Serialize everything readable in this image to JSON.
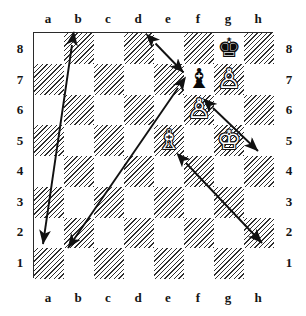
{
  "diagram": {
    "board": {
      "files": [
        "a",
        "b",
        "c",
        "d",
        "e",
        "f",
        "g",
        "h"
      ],
      "ranks": [
        "8",
        "7",
        "6",
        "5",
        "4",
        "3",
        "2",
        "1"
      ],
      "light_square_color": "#ffffff",
      "dark_square_color": "#2e2e2e",
      "border_color": "#2b2b2b",
      "dark_square_style": "diagonal-hatch"
    },
    "pieces": [
      {
        "square": "g8",
        "file": "g",
        "rank": "8",
        "color": "black",
        "type": "king",
        "glyph": "♚",
        "name": "black-king"
      },
      {
        "square": "f7",
        "file": "f",
        "rank": "7",
        "color": "black",
        "type": "bishop",
        "glyph": "♝",
        "name": "black-bishop"
      },
      {
        "square": "g7",
        "file": "g",
        "rank": "7",
        "color": "white",
        "type": "pawn",
        "glyph": "♙",
        "name": "white-pawn-g7"
      },
      {
        "square": "f6",
        "file": "f",
        "rank": "6",
        "color": "white",
        "type": "pawn",
        "glyph": "♙",
        "name": "white-pawn-f6"
      },
      {
        "square": "e5",
        "file": "e",
        "rank": "5",
        "color": "white",
        "type": "bishop",
        "glyph": "♗",
        "name": "white-bishop"
      },
      {
        "square": "g5",
        "file": "g",
        "rank": "5",
        "color": "white",
        "type": "king",
        "glyph": "♔",
        "name": "white-king"
      }
    ],
    "arrows": [
      {
        "id": "arrow-e8-f7",
        "from": "e8",
        "to": "f7",
        "double_headed": true,
        "length": "short",
        "color": "#111111"
      },
      {
        "id": "arrow-b8-a2",
        "from": "b8",
        "to": "a2",
        "double_headed": true,
        "length": "long",
        "color": "#111111"
      },
      {
        "id": "arrow-f7-b2",
        "from": "f7",
        "to": "b2",
        "double_headed": true,
        "length": "long",
        "color": "#111111"
      },
      {
        "id": "arrow-g6-h5",
        "from": "g6",
        "to": "h5",
        "double_headed": true,
        "length": "short",
        "color": "#111111"
      },
      {
        "id": "arrow-f4-h2",
        "from": "f4",
        "to": "h2",
        "double_headed": true,
        "length": "long",
        "color": "#111111"
      }
    ],
    "labels": {
      "top_files": [
        "a",
        "b",
        "c",
        "d",
        "e",
        "f",
        "g",
        "h"
      ],
      "bottom_files": [
        "a",
        "b",
        "c",
        "d",
        "e",
        "f",
        "g",
        "h"
      ],
      "left_ranks": [
        "8",
        "7",
        "6",
        "5",
        "4",
        "3",
        "2",
        "1"
      ],
      "right_ranks": [
        "8",
        "7",
        "6",
        "5",
        "4",
        "3",
        "2",
        "1"
      ]
    }
  }
}
